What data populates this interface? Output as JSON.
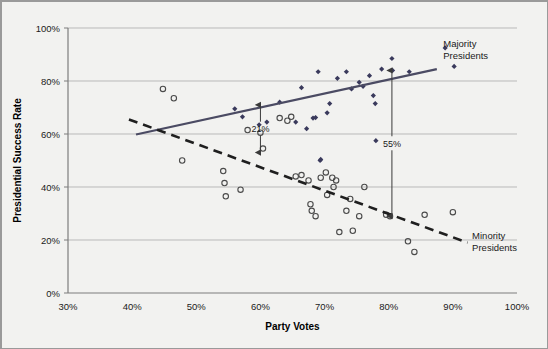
{
  "chart_data": {
    "type": "scatter",
    "title": "",
    "xlabel": "Party Votes",
    "ylabel": "Presidential Success Rate",
    "xlim": [
      30,
      100
    ],
    "ylim": [
      0,
      100
    ],
    "xticks": [
      "30%",
      "40%",
      "50%",
      "60%",
      "70%",
      "80%",
      "90%",
      "100%"
    ],
    "xtick_values": [
      30,
      40,
      50,
      60,
      70,
      80,
      90,
      100
    ],
    "yticks": [
      "0%",
      "20%",
      "40%",
      "60%",
      "80%",
      "100%"
    ],
    "ytick_values": [
      0,
      20,
      40,
      60,
      80,
      100
    ],
    "grid": "horizontal",
    "legend_position": "inline-right",
    "series": [
      {
        "name": "Majority Presidents",
        "marker": "filled-diamond",
        "color": "#3a3a5c",
        "points": [
          [
            56.0,
            69.5
          ],
          [
            57.2,
            66.5
          ],
          [
            59.8,
            63.5
          ],
          [
            61.0,
            64.5
          ],
          [
            63.0,
            72.0
          ],
          [
            65.5,
            64.5
          ],
          [
            66.4,
            77.5
          ],
          [
            67.2,
            62.0
          ],
          [
            68.2,
            66.0
          ],
          [
            68.6,
            66.2
          ],
          [
            69.0,
            83.5
          ],
          [
            69.3,
            50.0
          ],
          [
            69.4,
            50.4
          ],
          [
            70.4,
            68.0
          ],
          [
            70.8,
            71.5
          ],
          [
            72.0,
            81.0
          ],
          [
            73.4,
            83.5
          ],
          [
            74.2,
            77.0
          ],
          [
            75.4,
            79.5
          ],
          [
            76.0,
            78.0
          ],
          [
            77.0,
            82.0
          ],
          [
            77.6,
            74.5
          ],
          [
            77.9,
            71.5
          ],
          [
            78.0,
            57.5
          ],
          [
            78.9,
            84.5
          ],
          [
            80.5,
            88.5
          ],
          [
            80.6,
            84.0
          ],
          [
            83.2,
            83.5
          ],
          [
            88.8,
            92.5
          ],
          [
            90.2,
            85.5
          ]
        ]
      },
      {
        "name": "Minority Presidents",
        "marker": "open-circle",
        "color": "#4a4a4a",
        "points": [
          [
            44.8,
            77.0
          ],
          [
            46.5,
            73.5
          ],
          [
            47.8,
            50.0
          ],
          [
            54.2,
            46.0
          ],
          [
            54.4,
            41.5
          ],
          [
            54.6,
            36.5
          ],
          [
            56.9,
            39.0
          ],
          [
            58.0,
            61.5
          ],
          [
            60.0,
            60.5
          ],
          [
            60.4,
            54.5
          ],
          [
            63.0,
            66.0
          ],
          [
            64.2,
            65.0
          ],
          [
            64.8,
            66.5
          ],
          [
            65.5,
            44.0
          ],
          [
            66.4,
            44.5
          ],
          [
            67.5,
            42.5
          ],
          [
            67.8,
            33.5
          ],
          [
            68.0,
            31.0
          ],
          [
            68.6,
            29.0
          ],
          [
            69.4,
            43.5
          ],
          [
            70.2,
            45.5
          ],
          [
            70.4,
            37.0
          ],
          [
            71.2,
            43.5
          ],
          [
            71.4,
            40.0
          ],
          [
            71.8,
            42.5
          ],
          [
            72.3,
            23.0
          ],
          [
            73.4,
            31.0
          ],
          [
            74.0,
            35.5
          ],
          [
            74.4,
            23.5
          ],
          [
            75.4,
            29.0
          ],
          [
            76.2,
            40.0
          ],
          [
            79.6,
            29.5
          ],
          [
            80.2,
            29.0
          ],
          [
            83.0,
            19.5
          ],
          [
            84.0,
            15.5
          ],
          [
            85.6,
            29.5
          ],
          [
            90.0,
            30.5
          ]
        ]
      }
    ],
    "trendlines": [
      {
        "name": "Majority Presidents trendline",
        "style": "solid",
        "color": "#4b4b63",
        "x_start": 40.6,
        "y_start": 59.8,
        "x_end": 87.5,
        "y_end": 84.5
      },
      {
        "name": "Minority Presidents trendline",
        "style": "dashed",
        "color": "#1f1f1f",
        "x_start": 39.5,
        "y_start": 65.5,
        "x_end": 92.3,
        "y_end": 19.0
      }
    ],
    "annotations": [
      {
        "label": "21%",
        "x": 60.0,
        "y_top": 71.0,
        "y_bottom": 53.0
      },
      {
        "label": "55%",
        "x": 80.5,
        "y_top": 84.0,
        "y_bottom": 29.0
      }
    ],
    "series_labels": [
      {
        "text_line1": "Majority",
        "text_line2": "Presidents",
        "x": 88.5,
        "y": 93.0
      },
      {
        "text_line1": "Minority",
        "text_line2": "Presidents",
        "x": 93.0,
        "y": 20.5
      }
    ]
  },
  "colors": {
    "background": "#f2f2f0",
    "plot_background": "#f2f2f0",
    "frame_border": "#9a9a9a",
    "gridline": "#b9b9b9",
    "axis_line": "#7d7d7d",
    "majority_marker": "#3a3a5c",
    "minority_marker": "#4a4a4a",
    "majority_trend": "#4b4b63",
    "minority_trend": "#1f1f1f",
    "annotation": "#3a3a3a",
    "text": "#1a1a1a"
  }
}
